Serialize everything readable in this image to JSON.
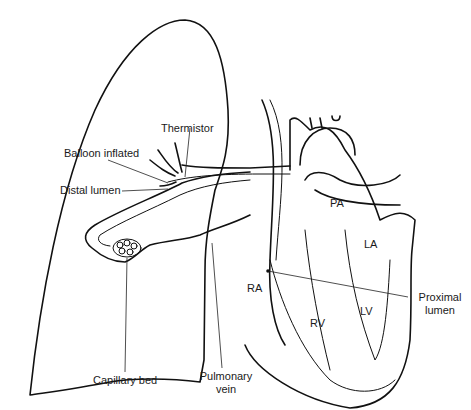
{
  "diagram": {
    "type": "anatomical-illustration",
    "labels": {
      "thermistor": "Thermistor",
      "balloon_inflated": "Balloon inflated",
      "distal_lumen": "Distal lumen",
      "capillary_bed": "Capillary bed",
      "pulmonary_vein_line1": "Pulmonary",
      "pulmonary_vein_line2": "vein",
      "pa": "PA",
      "la": "LA",
      "ra": "RA",
      "rv": "RV",
      "lv": "LV",
      "proximal_lumen_line1": "Proximal",
      "proximal_lumen_line2": "lumen"
    },
    "colors": {
      "line": "#111111",
      "background": "#ffffff"
    }
  }
}
